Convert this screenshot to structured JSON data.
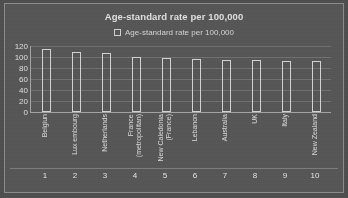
{
  "chart_data": {
    "type": "bar",
    "title": "Age-standard rate per 100,000",
    "xlabel": "",
    "ylabel": "",
    "ylim": [
      0,
      120
    ],
    "yticks": [
      120,
      100,
      80,
      60,
      40,
      20,
      0
    ],
    "grid": true,
    "legend_position": "top-center",
    "legend": [
      "Age-standard rate per 100,000"
    ],
    "categories": [
      "Belgiun",
      "Lux embourg",
      "Netherlands",
      "France\n(metropolitan)",
      "New Caledonia\n(France)",
      "Lebanon",
      "Australia",
      "UK",
      "Italy",
      "New Zealand"
    ],
    "ranks": [
      "1",
      "2",
      "3",
      "4",
      "5",
      "6",
      "7",
      "8",
      "9",
      "10"
    ],
    "series": [
      {
        "name": "Age-standard rate per 100,000",
        "values": [
          115,
          110,
          108,
          100,
          99,
          97,
          95,
          95,
          93,
          92
        ]
      }
    ]
  },
  "style": {
    "background": "#525252",
    "frame_border": "#8d8d8d",
    "bar_outline": "#dadada",
    "text": "#e4e4e4",
    "gridline": "#6e6e6e"
  }
}
